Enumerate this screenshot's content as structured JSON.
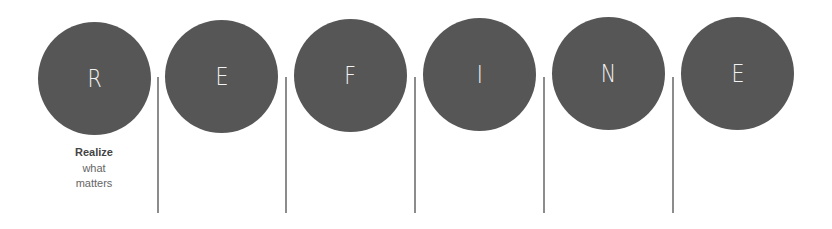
{
  "acronym": {
    "word": "REFINE",
    "letters": [
      {
        "letter": "R",
        "caption_title": "Realize",
        "caption_lines": [
          "what",
          "matters"
        ]
      },
      {
        "letter": "E"
      },
      {
        "letter": "F"
      },
      {
        "letter": "I"
      },
      {
        "letter": "N"
      },
      {
        "letter": "E"
      }
    ]
  },
  "colors": {
    "circle_fill": "#565656",
    "letter": "#f2f2f2",
    "divider": "#8c8c8c",
    "caption_title": "#444444",
    "caption_text": "#666666",
    "background": "#ffffff"
  }
}
